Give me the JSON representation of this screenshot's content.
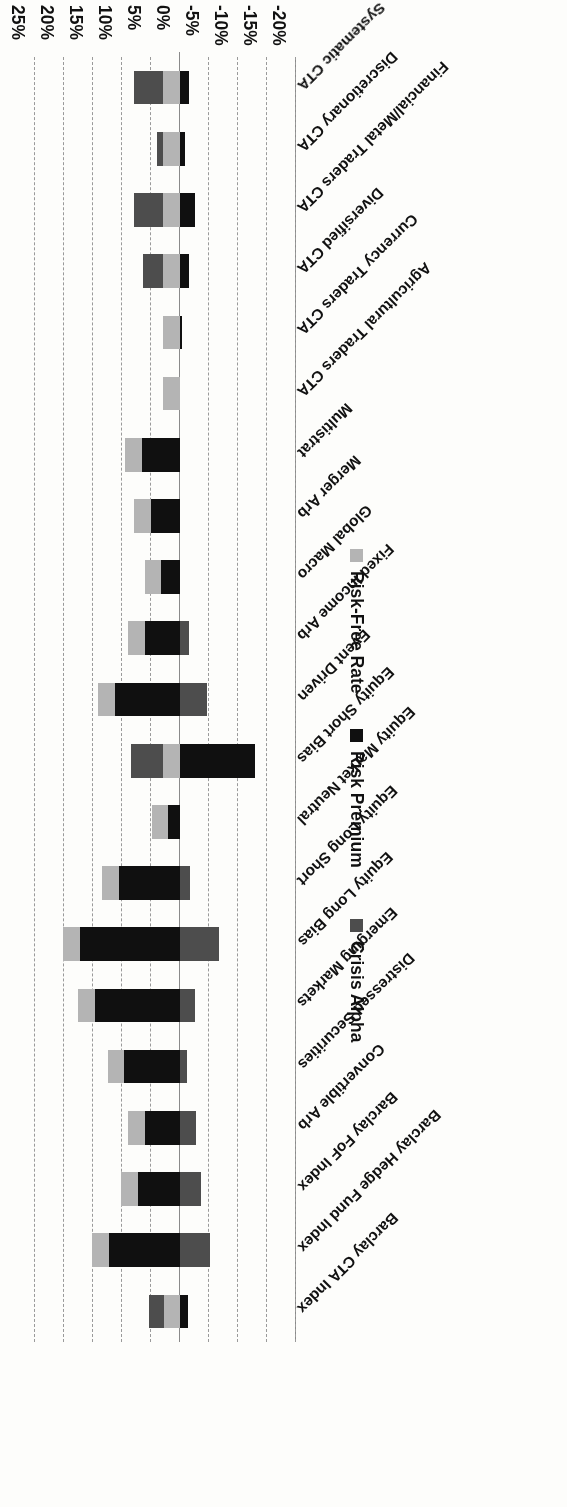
{
  "chart_data": {
    "type": "bar",
    "orientation": "horizontal",
    "stacked": true,
    "title": "",
    "xlabel": "",
    "ylabel": "",
    "xlim": [
      -20,
      25
    ],
    "xticks": [
      "25%",
      "20%",
      "15%",
      "10%",
      "5%",
      "0%",
      "-5%",
      "-10%",
      "-15%",
      "-20%"
    ],
    "xtick_values": [
      25,
      20,
      15,
      10,
      5,
      0,
      -5,
      -10,
      -15,
      -20
    ],
    "grid": true,
    "legend_position": "bottom",
    "categories": [
      "Barclay CTA Index",
      "Barclay Hedge Fund Index",
      "Barclay FoF Index",
      "Convertible Arb",
      "Distressed Securities",
      "Emerging Markets",
      "Equity Long Bias",
      "Equity Long Short",
      "Equity Market Neutral",
      "Equity Short Bias",
      "Event Driven",
      "Fixed Income Arb",
      "Global Macro",
      "Merger Arb",
      "Multistrat",
      "Agricultural Traders CTA",
      "Currency Traders CTA",
      "Diversified CTA",
      "Financial/Metal Traders CTA",
      "Discretionary CTA",
      "Systematic CTA"
    ],
    "series": [
      {
        "name": "Risk-Free Rate",
        "color": "#b4b4b4",
        "values": [
          2.8,
          2.9,
          2.9,
          2.9,
          2.9,
          2.9,
          2.9,
          2.9,
          2.9,
          2.9,
          2.9,
          2.9,
          2.9,
          2.9,
          2.9,
          2.9,
          2.9,
          2.9,
          2.9,
          2.9,
          2.9
        ]
      },
      {
        "name": "Risk Premium",
        "color": "#101010",
        "values": [
          -1.4,
          12.2,
          7.3,
          6.1,
          9.6,
          14.7,
          17.3,
          10.5,
          2.0,
          -12.9,
          11.2,
          6.0,
          3.2,
          5.0,
          6.6,
          0.0,
          -0.4,
          -1.6,
          -2.6,
          -0.8,
          -1.6
        ]
      },
      {
        "name": "Crisis Alpha",
        "color": "#4d4d4d",
        "values": [
          2.6,
          -5.1,
          -3.6,
          -2.7,
          -1.2,
          -2.6,
          -6.8,
          -1.7,
          0.0,
          5.6,
          -4.7,
          -1.5,
          0.0,
          0.0,
          0.0,
          0.0,
          0.0,
          3.5,
          5.0,
          1.1,
          5.0
        ]
      }
    ]
  },
  "legend": {
    "items": [
      {
        "label": "Risk-Free Rate",
        "color": "#b4b4b4",
        "icon": "square-swatch-icon"
      },
      {
        "label": "Risk Premium",
        "color": "#101010",
        "icon": "square-swatch-icon"
      },
      {
        "label": "Crisis Alpha",
        "color": "#4d4d4d",
        "icon": "square-swatch-icon"
      }
    ]
  }
}
